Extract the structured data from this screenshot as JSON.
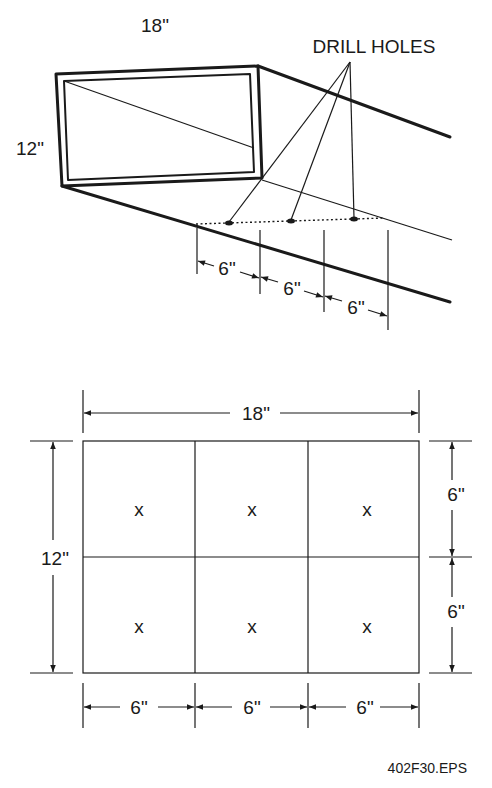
{
  "isometric_view": {
    "width_label": "18\"",
    "height_label": "12\"",
    "callout_label": "DRILL HOLES",
    "spacing_labels": [
      "6\"",
      "6\"",
      "6\""
    ]
  },
  "plan_view": {
    "width_label": "18\"",
    "height_label": "12\"",
    "right_labels": [
      "6\"",
      "6\""
    ],
    "bottom_labels": [
      "6\"",
      "6\"",
      "6\""
    ],
    "hole_marks": [
      "x",
      "x",
      "x",
      "x",
      "x",
      "x"
    ]
  },
  "figure_id": "402F30.EPS"
}
